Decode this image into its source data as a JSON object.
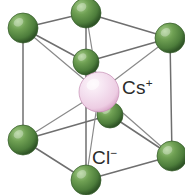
{
  "figure": {
    "width": 185,
    "height": 195,
    "background_color": "#ffffff",
    "projection": "oblique"
  },
  "labels": {
    "cation": {
      "text": "Cs",
      "charge": "+",
      "x": 122,
      "y": 78,
      "color": "#2b2b2b"
    },
    "anion": {
      "text": "Cl",
      "charge": "−",
      "x": 92,
      "y": 148,
      "color": "#2b2b2b"
    }
  },
  "colors": {
    "chloride_sphere": "#5a8c46",
    "chloride_highlight": "#9ac483",
    "chloride_shadow": "#2f5426",
    "cesium_sphere": "#f3dced",
    "cesium_highlight": "#fdf5fa",
    "cesium_shadow": "#dba9c9",
    "edge_line": "#6f6f6f",
    "center_line": "#8a8a8a"
  },
  "atoms": [
    {
      "id": "corner-back-top-left",
      "species": "Cl",
      "x": 23,
      "y": 28,
      "r": 15,
      "role": "corner"
    },
    {
      "id": "corner-front-top-left",
      "species": "Cl",
      "x": 86,
      "y": 13,
      "r": 15,
      "role": "corner"
    },
    {
      "id": "corner-back-top-right",
      "species": "Cl",
      "x": 86,
      "y": 62,
      "r": 13,
      "role": "corner"
    },
    {
      "id": "corner-front-top-right",
      "species": "Cl",
      "x": 170,
      "y": 38,
      "r": 15,
      "role": "corner"
    },
    {
      "id": "corner-back-bottom-left",
      "species": "Cl",
      "x": 23,
      "y": 140,
      "r": 15,
      "role": "corner"
    },
    {
      "id": "corner-front-bottom-left",
      "species": "Cl",
      "x": 86,
      "y": 180,
      "r": 15,
      "role": "corner"
    },
    {
      "id": "corner-back-bottom-right",
      "species": "Cl",
      "x": 110,
      "y": 115,
      "r": 13,
      "role": "corner"
    },
    {
      "id": "corner-front-bottom-right",
      "species": "Cl",
      "x": 172,
      "y": 156,
      "r": 15,
      "role": "corner"
    },
    {
      "id": "body-center-cesium",
      "species": "Cs",
      "x": 99,
      "y": 92,
      "r": 20,
      "role": "body-center"
    }
  ],
  "edges": [
    {
      "from": "corner-back-top-left",
      "to": "corner-front-top-left",
      "kind": "cell-edge"
    },
    {
      "from": "corner-back-top-left",
      "to": "corner-back-top-right",
      "kind": "cell-edge"
    },
    {
      "from": "corner-back-top-left",
      "to": "corner-back-bottom-left",
      "kind": "cell-edge"
    },
    {
      "from": "corner-front-top-left",
      "to": "corner-front-top-right",
      "kind": "cell-edge"
    },
    {
      "from": "corner-front-top-left",
      "to": "corner-front-bottom-left",
      "kind": "cell-edge"
    },
    {
      "from": "corner-back-top-right",
      "to": "corner-front-top-right",
      "kind": "cell-edge"
    },
    {
      "from": "corner-back-top-right",
      "to": "corner-back-bottom-right",
      "kind": "cell-edge"
    },
    {
      "from": "corner-front-top-right",
      "to": "corner-front-bottom-right",
      "kind": "cell-edge"
    },
    {
      "from": "corner-back-bottom-left",
      "to": "corner-front-bottom-left",
      "kind": "cell-edge"
    },
    {
      "from": "corner-back-bottom-left",
      "to": "corner-back-bottom-right",
      "kind": "cell-edge"
    },
    {
      "from": "corner-front-bottom-left",
      "to": "corner-front-bottom-right",
      "kind": "cell-edge"
    },
    {
      "from": "corner-back-bottom-right",
      "to": "corner-front-bottom-right",
      "kind": "cell-edge"
    },
    {
      "from": "body-center-cesium",
      "to": "corner-back-top-left",
      "kind": "center-bond"
    },
    {
      "from": "body-center-cesium",
      "to": "corner-front-top-left",
      "kind": "center-bond"
    },
    {
      "from": "body-center-cesium",
      "to": "corner-back-top-right",
      "kind": "center-bond"
    },
    {
      "from": "body-center-cesium",
      "to": "corner-front-top-right",
      "kind": "center-bond"
    },
    {
      "from": "body-center-cesium",
      "to": "corner-back-bottom-left",
      "kind": "center-bond"
    },
    {
      "from": "body-center-cesium",
      "to": "corner-front-bottom-left",
      "kind": "center-bond"
    },
    {
      "from": "body-center-cesium",
      "to": "corner-back-bottom-right",
      "kind": "center-bond"
    },
    {
      "from": "body-center-cesium",
      "to": "corner-front-bottom-right",
      "kind": "center-bond"
    }
  ]
}
